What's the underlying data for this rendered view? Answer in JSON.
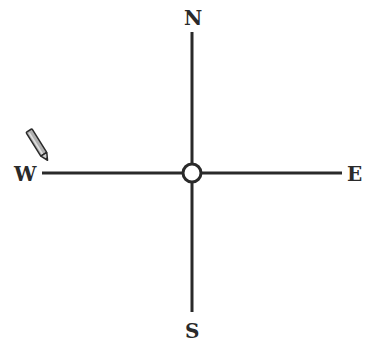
{
  "compass": {
    "labels": {
      "north": "N",
      "south": "S",
      "east": "E",
      "west": "W"
    },
    "center": {
      "x": 192,
      "y": 173
    },
    "line_color": "#2a2a2a",
    "background": "#ffffff"
  },
  "pencil": {
    "icon": "pencil-icon",
    "points_to": "W",
    "tip_color": "#2a2a2a",
    "body_color": "#b0b0b0"
  }
}
